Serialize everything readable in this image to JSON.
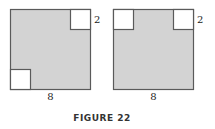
{
  "figure": {
    "caption": "FIGURE 22",
    "colors": {
      "fill": "#d3d3d3",
      "stroke": "#5a5a5a",
      "cutout": "#ffffff"
    },
    "panels": [
      {
        "name": "left",
        "side_label": "8",
        "corner_label": "2",
        "cutouts": [
          "top-right",
          "bottom-left"
        ]
      },
      {
        "name": "right",
        "side_label": "8",
        "corner_label": "2",
        "cutouts": [
          "top-left",
          "top-right"
        ]
      }
    ]
  }
}
